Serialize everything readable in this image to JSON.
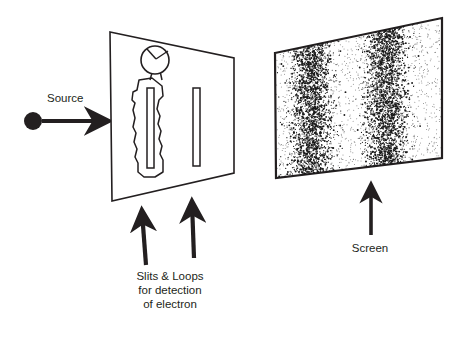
{
  "figure": {
    "background_color": "#ffffff",
    "ink_color": "#231f20"
  },
  "source": {
    "label": "Source",
    "emitter_icon": "filled-circle-icon",
    "beam_icon": "right-arrow-icon",
    "emitter": {
      "cx": 33,
      "cy": 121,
      "r": 9
    },
    "beam": {
      "x1": 42,
      "y1": 121,
      "x2": 112,
      "y2": 121
    },
    "label_pos": {
      "x": 47,
      "y": 102
    }
  },
  "slit_panel": {
    "name": "slit panel",
    "outline_points": "110,32 234,58 234,173 112,201",
    "slits": [
      {
        "name": "left-slit",
        "x": 147,
        "y": 88,
        "w": 7,
        "h": 80
      },
      {
        "name": "right-slit",
        "x": 193,
        "y": 88,
        "w": 7,
        "h": 78
      }
    ],
    "detector_loop": {
      "name": "detection-loop",
      "outline": "M152,78 L139,80 L137,90 L133,92 L132,100 L135,103 L133,110 L135,118 L133,127 L136,133 L134,142 L137,149 L135,157 L138,163 L138,172 L144,177 L155,177 L163,172 L163,160 L160,154 L162,146 L159,139 L161,131 L158,124 L160,116 L157,109 L159,100 L163,96 L162,86 L152,78 Z"
    },
    "meter": {
      "name": "detector-meter",
      "icon": "gauge-icon",
      "cx": 155,
      "cy": 60,
      "r": 14,
      "needle_to": {
        "x": 146,
        "y": 50
      },
      "lead_to": {
        "x": 168,
        "y": 50
      }
    }
  },
  "detection_arrows": [
    {
      "name": "slit-arrow-left",
      "x1": 146,
      "y1": 265,
      "x2": 142,
      "y2": 207
    },
    {
      "name": "slit-arrow-right",
      "x1": 194,
      "y1": 258,
      "x2": 192,
      "y2": 198
    }
  ],
  "slit_caption": {
    "name": "slits-loops-caption",
    "lines": [
      "Slits & Loops",
      "for detection",
      "of electron"
    ],
    "line1": "Slits & Loops",
    "line2": "for detection",
    "line3": "of electron",
    "anchor_x": 170,
    "line_y": [
      280,
      294,
      308
    ]
  },
  "screen": {
    "name": "detection screen",
    "label": "Screen",
    "outline_points": "275,53 442,18 442,158 276,178",
    "label_pos": {
      "x": 370,
      "y": 252
    },
    "arrow": {
      "name": "screen-arrow",
      "x1": 371,
      "y1": 235,
      "x2": 371,
      "y2": 181
    },
    "pattern": {
      "type": "particle-impact-scatter",
      "description": "two dense vertical bands of point impacts",
      "band_centers_x": [
        311,
        386
      ],
      "band_half_width": 18,
      "dot_count": 5200,
      "dot_color": "#1a1a1a"
    }
  },
  "chart_data": {
    "type": "scatter",
    "xlabel": "",
    "ylabel": "",
    "series": [
      {
        "name": "Left band impacts",
        "center_x": 311,
        "spread": 18,
        "relative_intensity": 1.0
      },
      {
        "name": "Right band impacts",
        "center_x": 386,
        "spread": 18,
        "relative_intensity": 1.0
      }
    ],
    "annotations": [
      "Source",
      "Slits & Loops",
      "for detection",
      "of electron",
      "Screen"
    ],
    "grid": false,
    "legend_position": "none"
  }
}
